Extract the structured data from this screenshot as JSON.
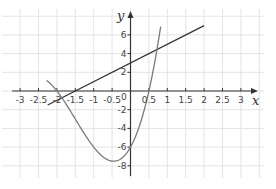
{
  "chart_data": {
    "type": "line",
    "title": "",
    "xlabel": "x",
    "ylabel": "y",
    "xlim": [
      -3.2,
      3.4
    ],
    "ylim": [
      -9,
      8.5
    ],
    "x_ticks": [
      -3,
      -2.5,
      -2,
      -1.5,
      -1,
      -0.5,
      0.5,
      1,
      1.5,
      2,
      2.5,
      3
    ],
    "x_tick_labels": [
      "-3",
      "-2.5",
      "-2",
      "-1.5",
      "-1",
      "-0.5",
      "0.5",
      "1",
      "1.5",
      "2",
      "2.5",
      "3"
    ],
    "y_ticks": [
      6,
      4,
      2,
      -2,
      -4,
      -6,
      -8
    ],
    "y_tick_labels": [
      "6",
      "4",
      "2",
      "-2",
      "-4",
      "-6",
      "-8"
    ],
    "origin_label": "0",
    "grid": true,
    "series": [
      {
        "name": "line",
        "equation": "y = 2x + 3",
        "color": "#333333",
        "x": [
          -2.25,
          2
        ],
        "y": [
          -1.5,
          7
        ]
      },
      {
        "name": "cubic curve",
        "equation": "y = (x + 2)(2x - 1)(x + 3)",
        "color": "#7a7a7a",
        "x": [
          -2.28,
          -2,
          -1.5,
          -1,
          -0.5,
          0,
          0.5,
          0.73,
          0.82
        ],
        "y": [
          1.1,
          0,
          -3.75,
          -6,
          -7.5,
          -6,
          0,
          4.7,
          6.9
        ]
      }
    ],
    "annotations": [
      {
        "text": "intersection",
        "x": -2.25,
        "y": -1.5
      },
      {
        "text": "intersection",
        "x": 0.73,
        "y": 4.46
      }
    ]
  },
  "axes": {
    "x_label": "x",
    "y_label": "y",
    "origin": "0"
  },
  "colors": {
    "grid": "#e4e4e4",
    "axis": "#333333",
    "line": "#333333",
    "curve": "#7a7a7a"
  }
}
